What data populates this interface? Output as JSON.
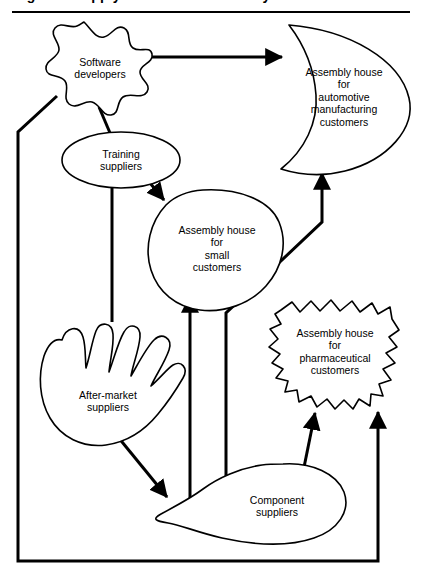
{
  "figure": {
    "title": "Figure 1  Supply network for assembly houses",
    "divider_color": "#000000",
    "background_color": "#ffffff",
    "line_color": "#000000"
  },
  "nodes": [
    {
      "id": "software-developers",
      "label": "Software\ndevelopers",
      "shape": "splat",
      "x": 20,
      "y": 22,
      "width": 130,
      "height": 105
    },
    {
      "id": "assembly-house-automotive",
      "label": "Assembly house\nfor\nautomotive\nmanufacturing\ncustomers",
      "shape": "crescent",
      "x": 268,
      "y": 24,
      "width": 145,
      "height": 148
    },
    {
      "id": "training-suppliers",
      "label": "Training\nsuppliers",
      "shape": "ellipse",
      "x": 62,
      "y": 133,
      "width": 118,
      "height": 58
    },
    {
      "id": "assembly-house-small",
      "label": "Assembly house\nfor\nsmall\ncustomers",
      "shape": "rounded-blob",
      "x": 148,
      "y": 189,
      "width": 135,
      "height": 122
    },
    {
      "id": "assembly-house-pharmaceutical",
      "label": "Assembly house\nfor\npharmaceutical\ncustomers",
      "shape": "starburst",
      "x": 270,
      "y": 300,
      "width": 130,
      "height": 108
    },
    {
      "id": "after-market-suppliers",
      "label": "After-market\nsuppliers",
      "shape": "hand",
      "x": 40,
      "y": 312,
      "width": 135,
      "height": 135
    },
    {
      "id": "component-suppliers",
      "label": "Component\nsuppliers",
      "shape": "teardrop",
      "x": 168,
      "y": 464,
      "width": 180,
      "height": 80
    }
  ],
  "edges": [
    {
      "id": "software-to-automotive",
      "from": "software-developers",
      "to": "assembly-house-automotive",
      "arrow": "to"
    },
    {
      "id": "software-to-training",
      "from": "software-developers",
      "to": "training-suppliers",
      "arrow": "none"
    },
    {
      "id": "software-to-pharmaceutical",
      "from": "software-developers",
      "to": "assembly-house-pharmaceutical",
      "arrow": "to"
    },
    {
      "id": "training-to-small",
      "from": "training-suppliers",
      "to": "assembly-house-small",
      "arrow": "to"
    },
    {
      "id": "training-to-after-market",
      "from": "training-suppliers",
      "to": "after-market-suppliers",
      "arrow": "none"
    },
    {
      "id": "after-market-to-component",
      "from": "after-market-suppliers",
      "to": "component-suppliers",
      "arrow": "to"
    },
    {
      "id": "component-to-small",
      "from": "component-suppliers",
      "to": "assembly-house-small",
      "arrow": "to"
    },
    {
      "id": "component-to-automotive",
      "from": "component-suppliers",
      "to": "assembly-house-automotive",
      "arrow": "to"
    },
    {
      "id": "component-to-pharmaceutical",
      "from": "component-suppliers",
      "to": "assembly-house-pharmaceutical",
      "arrow": "to"
    }
  ]
}
